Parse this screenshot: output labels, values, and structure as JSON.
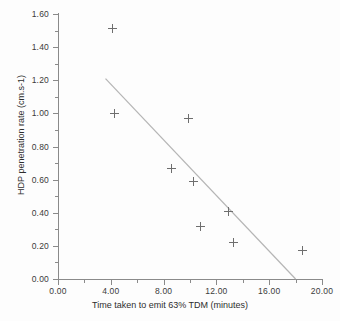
{
  "chart_data": {
    "type": "scatter",
    "title": "",
    "xlabel": "Time taken to emit 63% TDM (minutes)",
    "ylabel": "HDP penetration rate (cm.s-1)",
    "xlim": [
      0.0,
      20.0
    ],
    "ylim": [
      0.0,
      1.6
    ],
    "xticks": [
      "0.00",
      "4.00",
      "8.00",
      "12.00",
      "16.00",
      "20.00"
    ],
    "yticks": [
      "0.00",
      "0.20",
      "0.40",
      "0.60",
      "0.80",
      "1.00",
      "1.20",
      "1.40",
      "1.60"
    ],
    "xtick_values": [
      0.0,
      4.0,
      8.0,
      12.0,
      16.0,
      20.0
    ],
    "ytick_values": [
      0.0,
      0.2,
      0.4,
      0.6,
      0.8,
      1.0,
      1.2,
      1.4,
      1.6
    ],
    "minor_tick_interval_x": 2.0,
    "minor_tick_interval_y": 0.1,
    "grid": false,
    "legend": "none",
    "marker_symbol": "plus",
    "marker_color": "#6e6e6e",
    "axis_color": "#8a8a8a",
    "trendline_color": "#b5b5b5",
    "points": [
      {
        "x": 4.15,
        "y": 1.51
      },
      {
        "x": 4.25,
        "y": 1.0
      },
      {
        "x": 9.9,
        "y": 0.97
      },
      {
        "x": 8.6,
        "y": 0.665
      },
      {
        "x": 10.3,
        "y": 0.59
      },
      {
        "x": 12.9,
        "y": 0.41
      },
      {
        "x": 10.8,
        "y": 0.32
      },
      {
        "x": 13.3,
        "y": 0.22
      },
      {
        "x": 18.5,
        "y": 0.17
      }
    ],
    "trendline": {
      "x1": 3.6,
      "y1": 1.21,
      "x2": 18.0,
      "y2": 0.0
    }
  }
}
